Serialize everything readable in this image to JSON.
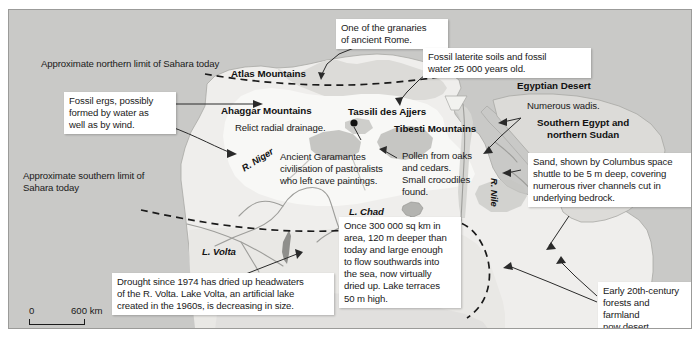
{
  "figure": {
    "background_color": "#c9c9c7",
    "land_color": "#efeeec",
    "sahara_color": "#f7f7f5",
    "highland_color": "#b9b9b6",
    "water_color": "#d9d9d6",
    "text_color": "#1a1a1a"
  },
  "scale_bar": {
    "zero_label": "0",
    "max_label": "600 km"
  },
  "limits": {
    "north": "Approximate northern limit of Sahara today",
    "south": "Approximate southern limit of\nSahara today"
  },
  "region_labels": [
    {
      "name": "atlas-mountains",
      "text": "Atlas Mountains"
    },
    {
      "name": "ahaggar-mountains",
      "text": "Ahaggar Mountains"
    },
    {
      "name": "tassili-des-ajjers",
      "text": "Tassili des Ajjers"
    },
    {
      "name": "tibesti-mountains",
      "text": "Tibesti Mountains"
    },
    {
      "name": "egyptian-desert",
      "text": "Egyptian Desert"
    },
    {
      "name": "southern-egypt-northern-sudan",
      "text": "Southern Egypt and\nnorthern Sudan"
    }
  ],
  "water_labels": [
    {
      "name": "lake-chad",
      "text": "L. Chad"
    },
    {
      "name": "lake-volta",
      "text": "L. Volta"
    },
    {
      "name": "river-niger",
      "text": "R. Niger"
    },
    {
      "name": "river-nile",
      "text": "R. Nile"
    }
  ],
  "map_notes": [
    {
      "name": "relict-radial-drainage",
      "text": "Relict radial drainage."
    },
    {
      "name": "ancient-garamantes",
      "text": "Ancient Garamantes\ncivilisation of pastoralists\nwho left cave paintings."
    },
    {
      "name": "pollen-oaks-cedars",
      "text": "Pollen from oaks\nand cedars.\nSmall crocodiles\nfound."
    },
    {
      "name": "numerous-wadis",
      "text": "Numerous wadis."
    }
  ],
  "callouts": [
    {
      "name": "callout-granaries-rome",
      "text": "One of the granaries\nof ancient Rome."
    },
    {
      "name": "callout-fossil-laterite",
      "text": "Fossil laterite soils and fossil\nwater 25 000 years old."
    },
    {
      "name": "callout-fossil-ergs",
      "text": "Fossil ergs, possibly\nformed by water as\nwell as by wind."
    },
    {
      "name": "callout-sand-columbus",
      "text": "Sand, shown by Columbus space\nshuttle to be 5 m deep, covering\nnumerous river channels cut in\nunderlying bedrock."
    },
    {
      "name": "callout-lake-chad-extent",
      "text": "Once 300 000 sq km in\narea, 120 m deeper than\ntoday and large enough\nto flow southwards into\nthe sea, now virtually\ndried up.  Lake terraces\n50 m high."
    },
    {
      "name": "callout-volta-drought",
      "text": "Drought since 1974 has dried up headwaters\nof the R. Volta. Lake Volta, an artificial lake\ncreated in the 1960s, is decreasing in size."
    },
    {
      "name": "callout-early-20th-century",
      "text": "Early 20th-century\nforests and farmland\nnow desert."
    }
  ]
}
